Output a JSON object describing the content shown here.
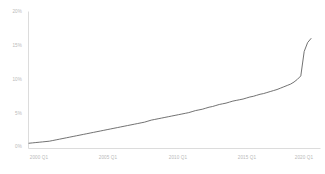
{
  "chart_data": {
    "type": "line",
    "title": "",
    "subtitle": "",
    "xlabel": "",
    "ylabel": "",
    "grid": false,
    "legend": false,
    "legend_position": "none",
    "line_color": "#595959",
    "axis_color": "#dcdcdc",
    "tick_label_color": "#b9b9b9",
    "background_color": "#ffffff",
    "ylim": [
      0,
      20
    ],
    "y_ticks": [
      0,
      5,
      10,
      15,
      20
    ],
    "y_tick_labels": [
      "0%",
      "5%",
      "10%",
      "15%",
      "20%"
    ],
    "xlim": [
      "2000 Q1",
      "2020 Q4"
    ],
    "x_ticks": [
      "2000 Q1",
      "2005 Q1",
      "2010 Q1",
      "2015 Q1",
      "2020 Q1"
    ],
    "x_tick_labels": [
      "2000 Q1",
      "2005 Q1",
      "2010 Q1",
      "2015 Q1",
      "2020 Q1"
    ],
    "series": [
      {
        "name": "",
        "x": [
          "2000 Q1",
          "2000 Q2",
          "2000 Q3",
          "2000 Q4",
          "2001 Q1",
          "2001 Q2",
          "2001 Q3",
          "2001 Q4",
          "2002 Q1",
          "2002 Q2",
          "2002 Q3",
          "2002 Q4",
          "2003 Q1",
          "2003 Q2",
          "2003 Q3",
          "2003 Q4",
          "2004 Q1",
          "2004 Q2",
          "2004 Q3",
          "2004 Q4",
          "2005 Q1",
          "2005 Q2",
          "2005 Q3",
          "2005 Q4",
          "2006 Q1",
          "2006 Q2",
          "2006 Q3",
          "2006 Q4",
          "2007 Q1",
          "2007 Q2",
          "2007 Q3",
          "2007 Q4",
          "2008 Q1",
          "2008 Q2",
          "2008 Q3",
          "2008 Q4",
          "2009 Q1",
          "2009 Q2",
          "2009 Q3",
          "2009 Q4",
          "2010 Q1",
          "2010 Q2",
          "2010 Q3",
          "2010 Q4",
          "2011 Q1",
          "2011 Q2",
          "2011 Q3",
          "2011 Q4",
          "2012 Q1",
          "2012 Q2",
          "2012 Q3",
          "2012 Q4",
          "2013 Q1",
          "2013 Q2",
          "2013 Q3",
          "2013 Q4",
          "2014 Q1",
          "2014 Q2",
          "2014 Q3",
          "2014 Q4",
          "2015 Q1",
          "2015 Q2",
          "2015 Q3",
          "2015 Q4",
          "2016 Q1",
          "2016 Q2",
          "2016 Q3",
          "2016 Q4",
          "2017 Q1",
          "2017 Q2",
          "2017 Q3",
          "2017 Q4",
          "2018 Q1",
          "2018 Q2",
          "2018 Q3",
          "2018 Q4",
          "2019 Q1",
          "2019 Q2",
          "2019 Q3",
          "2019 Q4",
          "2020 Q1",
          "2020 Q2",
          "2020 Q3",
          "2020 Q4"
        ],
        "values": [
          0.7,
          0.75,
          0.8,
          0.85,
          0.9,
          0.95,
          1.0,
          1.1,
          1.2,
          1.3,
          1.4,
          1.5,
          1.6,
          1.7,
          1.8,
          1.9,
          2.0,
          2.1,
          2.2,
          2.3,
          2.4,
          2.5,
          2.6,
          2.7,
          2.8,
          2.9,
          3.0,
          3.1,
          3.2,
          3.3,
          3.4,
          3.5,
          3.6,
          3.7,
          3.8,
          3.95,
          4.1,
          4.2,
          4.3,
          4.4,
          4.5,
          4.6,
          4.7,
          4.8,
          4.9,
          5.0,
          5.1,
          5.2,
          5.35,
          5.5,
          5.6,
          5.7,
          5.85,
          6.0,
          6.1,
          6.25,
          6.4,
          6.5,
          6.6,
          6.75,
          6.9,
          7.0,
          7.1,
          7.2,
          7.35,
          7.5,
          7.6,
          7.75,
          7.9,
          8.0,
          8.15,
          8.3,
          8.45,
          8.6,
          8.8,
          9.0,
          9.2,
          9.4,
          9.7,
          10.1,
          10.6,
          14.2,
          15.5,
          16.1
        ]
      }
    ]
  }
}
